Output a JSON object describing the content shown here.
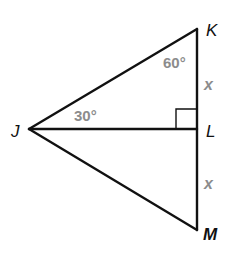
{
  "diagram": {
    "type": "geometry",
    "vertices": {
      "K": {
        "label": "K",
        "x": 197,
        "y": 29
      },
      "J": {
        "label": "J",
        "x": 29,
        "y": 129
      },
      "L": {
        "label": "L",
        "x": 197,
        "y": 129
      },
      "M": {
        "label": "M",
        "x": 197,
        "y": 230
      }
    },
    "segments": [
      "JK",
      "KL",
      "LM",
      "JL",
      "JM"
    ],
    "angles": {
      "angle_K": "60°",
      "angle_J": "30°",
      "right_angle_at": "L"
    },
    "segment_labels": {
      "KL": "x",
      "LM": "x"
    },
    "colors": {
      "lines": "#111111",
      "annotations": "#8c8c8c"
    }
  }
}
